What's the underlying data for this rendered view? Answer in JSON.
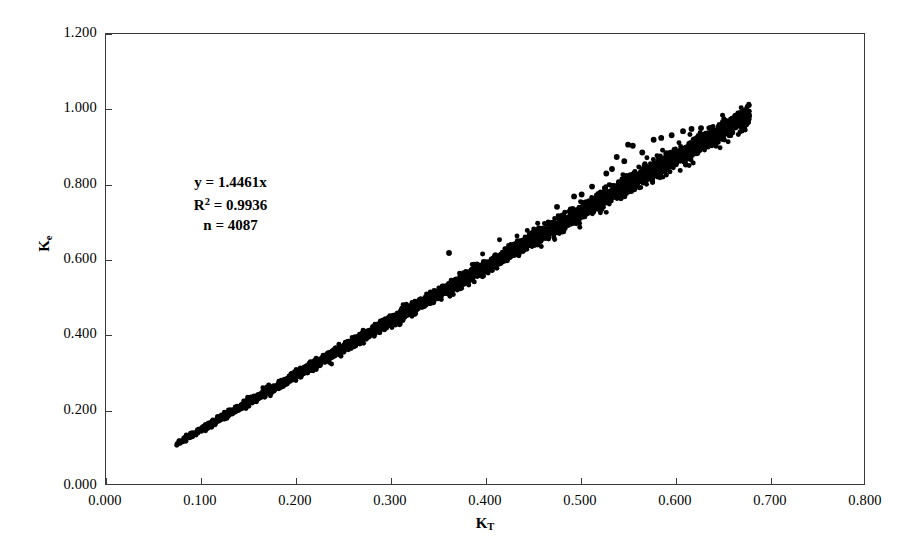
{
  "chart_data": {
    "type": "scatter",
    "title": "",
    "subtitle": "",
    "xlabel": "K_T",
    "ylabel": "K_e",
    "xlabel_base": "K",
    "xlabel_sub": "T",
    "ylabel_base": "K",
    "ylabel_sub": "e",
    "xlim": [
      0.0,
      0.8
    ],
    "ylim": [
      0.0,
      1.2
    ],
    "xticks": [
      0.0,
      0.1,
      0.2,
      0.3,
      0.4,
      0.5,
      0.6,
      0.7,
      0.8
    ],
    "yticks": [
      0.0,
      0.2,
      0.4,
      0.6,
      0.8,
      1.0,
      1.2
    ],
    "xtick_labels": [
      "0.000",
      "0.100",
      "0.200",
      "0.300",
      "0.400",
      "0.500",
      "0.600",
      "0.700",
      "0.800"
    ],
    "ytick_labels": [
      "0.000",
      "0.200",
      "0.400",
      "0.600",
      "0.800",
      "1.000",
      "1.200"
    ],
    "grid": false,
    "legend": "none",
    "marker_color": "#000000",
    "marker_shape": "circle",
    "marker_size_px": 5,
    "frame_color": "#3a3a3a",
    "background_color": "#ffffff",
    "n_points": 4087,
    "fit_slope": 1.4461,
    "fit_intercept": 0.0,
    "r_squared": 0.9936,
    "band_x_min": 0.074,
    "band_x_max": 0.679,
    "band_half_width": 0.011,
    "outliers": [
      {
        "x": 0.362,
        "y": 0.616
      },
      {
        "x": 0.476,
        "y": 0.739
      },
      {
        "x": 0.494,
        "y": 0.767
      },
      {
        "x": 0.502,
        "y": 0.772
      },
      {
        "x": 0.513,
        "y": 0.793
      },
      {
        "x": 0.528,
        "y": 0.828
      },
      {
        "x": 0.534,
        "y": 0.84
      },
      {
        "x": 0.539,
        "y": 0.872
      },
      {
        "x": 0.547,
        "y": 0.861
      },
      {
        "x": 0.551,
        "y": 0.905
      },
      {
        "x": 0.556,
        "y": 0.902
      },
      {
        "x": 0.566,
        "y": 0.884
      },
      {
        "x": 0.578,
        "y": 0.918
      },
      {
        "x": 0.586,
        "y": 0.923
      },
      {
        "x": 0.597,
        "y": 0.93
      },
      {
        "x": 0.609,
        "y": 0.941
      },
      {
        "x": 0.618,
        "y": 0.947
      },
      {
        "x": 0.628,
        "y": 0.949
      }
    ]
  },
  "annotation": {
    "line1": "y = 1.4461x",
    "line2_base": "R",
    "line2_sup": "2",
    "line2_rest": " = 0.9936",
    "line3": "n = 4087"
  }
}
